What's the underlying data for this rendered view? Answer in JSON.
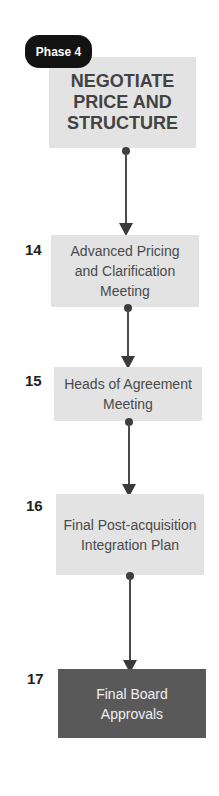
{
  "phase": {
    "label": "Phase 4",
    "title": "NEGOTIATE PRICE AND STRUCTURE"
  },
  "steps": [
    {
      "number": "14",
      "label": "Advanced Pricing and Clarification Meeting"
    },
    {
      "number": "15",
      "label": "Heads of Agreement Meeting"
    },
    {
      "number": "16",
      "label": "Final Post-acquisition Integration Plan"
    },
    {
      "number": "17",
      "label": "Final Board Approvals"
    }
  ],
  "colors": {
    "box": "#e3e3e3",
    "final_box": "#595959",
    "badge": "#131313",
    "connector": "#4a4a4a"
  }
}
